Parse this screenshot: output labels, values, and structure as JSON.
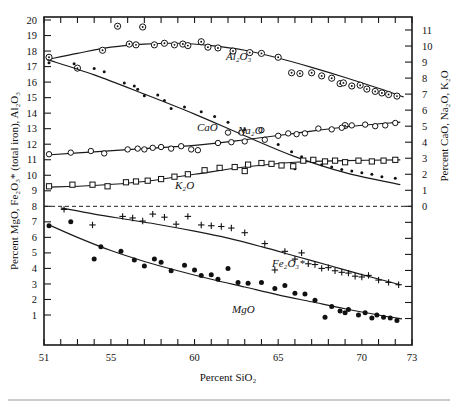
{
  "figure": {
    "background": "#ffffff",
    "ink_color": "#111111"
  },
  "axes": {
    "x_title": "Percent SiO₂",
    "y_left_title": "Percent MgO, Fe₂O₃* (total iron), Al₂O₃",
    "y_right_title": "Percent CaO, Na₂O, K₂O",
    "x_ticklabels": [
      "51",
      "55",
      "60",
      "65",
      "70",
      "73"
    ],
    "x_tickvalues": [
      51,
      55,
      60,
      65,
      70,
      73
    ],
    "y_left_ticklabels": [
      "1",
      "2",
      "3",
      "4",
      "5",
      "6",
      "7",
      "8",
      "9",
      "10",
      "11",
      "12",
      "13",
      "14",
      "15",
      "16",
      "17",
      "18",
      "19",
      "20"
    ],
    "y_right_ticklabels": [
      "0",
      "1",
      "2",
      "3",
      "4",
      "5",
      "6",
      "7",
      "8",
      "9",
      "10",
      "11"
    ],
    "zero_reference_label": "0"
  },
  "curve_labels": {
    "al2o3": "Al₂O₃",
    "cao": "CaO",
    "na2o": "Na₂O",
    "k2o": "K₂O",
    "fe2o3": "Fe₂O₃*",
    "mgo": "MgO"
  },
  "chart_data": {
    "type": "scatter",
    "title": "",
    "subtitle": "",
    "xlabel": "Percent SiO₂",
    "ylabel": "Percent MgO, Fe₂O₃* (total iron), Al₂O₃",
    "ylabel_right": "Percent CaO, Na₂O, K₂O",
    "xlim": [
      51,
      73
    ],
    "ylim_left": [
      0,
      20
    ],
    "ylim_right": [
      0,
      11
    ],
    "right_axis_offset_note": "right axis 0 aligns with left axis 8",
    "grid": false,
    "legend": "inline curve labels",
    "annotations": [
      {
        "text": "Al₂O₃",
        "x": 62.0,
        "y_left": 17.6
      },
      {
        "text": "CaO",
        "x": 60.2,
        "y_left": 13.0
      },
      {
        "text": "Na₂O",
        "x": 62.6,
        "y_left": 13.0
      },
      {
        "text": "K₂O",
        "x": 59.0,
        "y_left": 10.3
      },
      {
        "text": "Fe₂O₃*",
        "x": 64.5,
        "y_left": 5.6
      },
      {
        "text": "MgO",
        "x": 62.3,
        "y_left": 3.2
      }
    ],
    "reference_lines": [
      {
        "orientation": "horizontal",
        "y_left": 8,
        "y_right": 0,
        "style": "dashed"
      }
    ],
    "series": [
      {
        "name": "Al₂O₃",
        "axis": "left",
        "marker": "circle-with-dot",
        "points": [
          [
            51.3,
            17.6
          ],
          [
            53.0,
            16.9
          ],
          [
            54.5,
            18.05
          ],
          [
            55.4,
            19.6
          ],
          [
            56.1,
            18.45
          ],
          [
            56.5,
            18.4
          ],
          [
            56.9,
            19.55
          ],
          [
            57.6,
            18.4
          ],
          [
            58.2,
            18.5
          ],
          [
            58.8,
            18.4
          ],
          [
            59.3,
            18.45
          ],
          [
            59.6,
            18.35
          ],
          [
            60.4,
            18.6
          ],
          [
            60.8,
            18.25
          ],
          [
            61.4,
            18.2
          ],
          [
            62.3,
            18.0
          ],
          [
            63.3,
            17.9
          ],
          [
            64.0,
            17.85
          ],
          [
            65.0,
            17.6
          ],
          [
            65.8,
            16.6
          ],
          [
            66.3,
            16.55
          ],
          [
            67.0,
            16.6
          ],
          [
            67.6,
            16.4
          ],
          [
            68.2,
            16.25
          ],
          [
            68.7,
            15.9
          ],
          [
            68.9,
            15.95
          ],
          [
            69.4,
            15.75
          ],
          [
            69.9,
            15.8
          ],
          [
            70.3,
            15.55
          ],
          [
            70.8,
            15.4
          ],
          [
            71.2,
            15.3
          ],
          [
            71.6,
            15.2
          ],
          [
            72.1,
            15.1
          ],
          [
            69.0,
            13.2
          ]
        ],
        "trend": [
          [
            51.2,
            17.45
          ],
          [
            53.0,
            17.85
          ],
          [
            55.0,
            18.25
          ],
          [
            57.0,
            18.45
          ],
          [
            59.0,
            18.5
          ],
          [
            61.0,
            18.35
          ],
          [
            63.0,
            18.05
          ],
          [
            65.0,
            17.55
          ],
          [
            67.0,
            16.95
          ],
          [
            69.0,
            16.3
          ],
          [
            71.0,
            15.6
          ],
          [
            72.5,
            15.05
          ]
        ]
      },
      {
        "name": "CaO",
        "axis": "right",
        "marker": "small-dot",
        "points": [
          [
            51.3,
            8.95
          ],
          [
            52.8,
            8.9
          ],
          [
            54.0,
            8.6
          ],
          [
            54.6,
            8.4
          ],
          [
            55.8,
            7.7
          ],
          [
            56.4,
            7.5
          ],
          [
            56.6,
            7.3
          ],
          [
            57.0,
            6.9
          ],
          [
            57.8,
            6.95
          ],
          [
            58.2,
            6.6
          ],
          [
            58.6,
            6.1
          ],
          [
            59.4,
            6.2
          ],
          [
            60.4,
            5.9
          ],
          [
            61.2,
            5.6
          ],
          [
            62.0,
            5.25
          ],
          [
            63.0,
            4.8
          ],
          [
            64.2,
            4.25
          ],
          [
            65.0,
            3.85
          ],
          [
            65.8,
            3.4
          ],
          [
            66.4,
            3.1
          ],
          [
            67.0,
            2.95
          ],
          [
            67.6,
            2.6
          ],
          [
            68.2,
            2.45
          ],
          [
            68.8,
            2.3
          ],
          [
            69.4,
            2.2
          ],
          [
            70.0,
            2.1
          ],
          [
            70.6,
            2.0
          ],
          [
            71.2,
            1.85
          ],
          [
            72.0,
            1.75
          ],
          [
            66.0,
            2.35
          ]
        ],
        "trend": [
          [
            51.2,
            9.15
          ],
          [
            54.0,
            8.2
          ],
          [
            57.0,
            7.0
          ],
          [
            60.0,
            5.75
          ],
          [
            63.0,
            4.4
          ],
          [
            66.0,
            3.1
          ],
          [
            69.0,
            2.1
          ],
          [
            72.3,
            1.35
          ]
        ]
      },
      {
        "name": "Na₂O",
        "axis": "right",
        "marker": "open-circle",
        "points": [
          [
            51.3,
            3.25
          ],
          [
            52.6,
            3.35
          ],
          [
            53.8,
            3.45
          ],
          [
            54.6,
            3.3
          ],
          [
            56.0,
            3.55
          ],
          [
            56.6,
            3.6
          ],
          [
            57.0,
            3.55
          ],
          [
            57.5,
            3.65
          ],
          [
            58.0,
            3.7
          ],
          [
            58.6,
            3.6
          ],
          [
            59.2,
            3.75
          ],
          [
            59.8,
            3.55
          ],
          [
            60.2,
            3.5
          ],
          [
            61.4,
            3.95
          ],
          [
            62.2,
            4.0
          ],
          [
            63.0,
            4.05
          ],
          [
            64.2,
            4.15
          ],
          [
            65.0,
            4.4
          ],
          [
            65.6,
            4.55
          ],
          [
            66.1,
            4.5
          ],
          [
            66.6,
            4.55
          ],
          [
            67.4,
            4.85
          ],
          [
            68.2,
            4.8
          ],
          [
            68.8,
            4.9
          ],
          [
            69.4,
            5.05
          ],
          [
            70.2,
            5.1
          ],
          [
            70.8,
            5.0
          ],
          [
            71.4,
            5.05
          ],
          [
            72.0,
            5.2
          ],
          [
            62.0,
            4.6
          ],
          [
            62.8,
            4.6
          ],
          [
            64.0,
            4.75
          ]
        ],
        "trend": [
          [
            51.2,
            3.2
          ],
          [
            54.0,
            3.4
          ],
          [
            57.0,
            3.6
          ],
          [
            60.0,
            3.8
          ],
          [
            63.0,
            4.15
          ],
          [
            66.0,
            4.55
          ],
          [
            69.0,
            4.95
          ],
          [
            72.3,
            5.25
          ]
        ]
      },
      {
        "name": "K₂O",
        "axis": "right",
        "marker": "open-square",
        "points": [
          [
            51.3,
            1.25
          ],
          [
            52.7,
            1.35
          ],
          [
            53.9,
            1.35
          ],
          [
            54.8,
            1.25
          ],
          [
            55.9,
            1.5
          ],
          [
            56.5,
            1.55
          ],
          [
            57.2,
            1.6
          ],
          [
            58.0,
            1.7
          ],
          [
            58.8,
            1.85
          ],
          [
            59.6,
            2.0
          ],
          [
            60.6,
            2.25
          ],
          [
            61.5,
            2.4
          ],
          [
            62.4,
            2.45
          ],
          [
            63.2,
            2.6
          ],
          [
            64.0,
            2.7
          ],
          [
            64.6,
            2.65
          ],
          [
            65.2,
            2.55
          ],
          [
            65.9,
            2.5
          ],
          [
            66.5,
            2.85
          ],
          [
            67.1,
            2.9
          ],
          [
            67.8,
            2.8
          ],
          [
            68.4,
            2.85
          ],
          [
            69.0,
            2.75
          ],
          [
            69.8,
            2.85
          ],
          [
            70.6,
            2.8
          ],
          [
            71.3,
            2.85
          ],
          [
            72.0,
            2.9
          ],
          [
            63.0,
            2.2
          ]
        ],
        "trend": [
          [
            51.2,
            1.2
          ],
          [
            54.0,
            1.3
          ],
          [
            57.0,
            1.55
          ],
          [
            60.0,
            2.0
          ],
          [
            63.0,
            2.45
          ],
          [
            66.0,
            2.75
          ],
          [
            69.0,
            2.85
          ],
          [
            72.3,
            2.9
          ]
        ]
      },
      {
        "name": "Fe₂O₃*",
        "axis": "left",
        "marker": "plus",
        "points": [
          [
            52.2,
            7.8
          ],
          [
            53.9,
            6.8
          ],
          [
            55.7,
            7.35
          ],
          [
            56.3,
            7.25
          ],
          [
            56.9,
            7.05
          ],
          [
            57.5,
            7.5
          ],
          [
            58.2,
            7.3
          ],
          [
            58.9,
            6.85
          ],
          [
            59.6,
            7.35
          ],
          [
            60.4,
            6.8
          ],
          [
            61.0,
            6.75
          ],
          [
            61.6,
            6.7
          ],
          [
            62.2,
            6.6
          ],
          [
            63.0,
            6.3
          ],
          [
            64.2,
            5.6
          ],
          [
            65.4,
            5.1
          ],
          [
            66.0,
            4.6
          ],
          [
            66.8,
            4.3
          ],
          [
            67.2,
            4.25
          ],
          [
            67.6,
            4.0
          ],
          [
            68.0,
            4.05
          ],
          [
            68.4,
            3.85
          ],
          [
            68.8,
            3.75
          ],
          [
            69.2,
            3.7
          ],
          [
            69.6,
            3.5
          ],
          [
            70.0,
            3.45
          ],
          [
            70.4,
            3.55
          ],
          [
            71.0,
            3.25
          ],
          [
            71.6,
            3.1
          ],
          [
            72.2,
            2.95
          ],
          [
            64.8,
            3.9
          ],
          [
            66.4,
            5.0
          ]
        ],
        "trend": [
          [
            52.0,
            7.9
          ],
          [
            54.0,
            7.5
          ],
          [
            56.0,
            7.15
          ],
          [
            58.0,
            6.8
          ],
          [
            60.0,
            6.4
          ],
          [
            62.0,
            5.95
          ],
          [
            64.0,
            5.4
          ],
          [
            66.0,
            4.8
          ],
          [
            68.0,
            4.2
          ],
          [
            70.0,
            3.6
          ],
          [
            72.3,
            2.95
          ]
        ]
      },
      {
        "name": "MgO",
        "axis": "left",
        "marker": "filled-circle",
        "points": [
          [
            51.3,
            6.75
          ],
          [
            52.6,
            7.0
          ],
          [
            54.0,
            4.6
          ],
          [
            54.4,
            5.4
          ],
          [
            55.6,
            5.1
          ],
          [
            56.4,
            4.55
          ],
          [
            57.0,
            4.15
          ],
          [
            57.6,
            4.6
          ],
          [
            58.0,
            4.4
          ],
          [
            58.6,
            3.85
          ],
          [
            59.4,
            4.2
          ],
          [
            60.0,
            3.9
          ],
          [
            61.0,
            3.6
          ],
          [
            62.0,
            4.0
          ],
          [
            62.6,
            3.1
          ],
          [
            63.2,
            3.05
          ],
          [
            64.0,
            3.1
          ],
          [
            64.8,
            2.7
          ],
          [
            65.4,
            2.9
          ],
          [
            66.0,
            2.4
          ],
          [
            66.6,
            2.35
          ],
          [
            67.2,
            1.95
          ],
          [
            67.8,
            0.85
          ],
          [
            68.2,
            1.55
          ],
          [
            68.7,
            1.25
          ],
          [
            69.0,
            1.15
          ],
          [
            69.2,
            1.35
          ],
          [
            69.8,
            1.0
          ],
          [
            70.2,
            1.15
          ],
          [
            70.6,
            0.8
          ],
          [
            70.9,
            1.0
          ],
          [
            71.3,
            0.85
          ],
          [
            71.7,
            0.8
          ],
          [
            72.1,
            0.65
          ],
          [
            60.4,
            3.55
          ],
          [
            61.4,
            3.3
          ]
        ],
        "trend": [
          [
            51.2,
            6.85
          ],
          [
            53.0,
            6.0
          ],
          [
            55.0,
            5.15
          ],
          [
            57.0,
            4.45
          ],
          [
            59.0,
            3.85
          ],
          [
            61.0,
            3.3
          ],
          [
            63.0,
            2.8
          ],
          [
            65.0,
            2.3
          ],
          [
            67.0,
            1.85
          ],
          [
            69.0,
            1.4
          ],
          [
            71.0,
            1.0
          ],
          [
            72.4,
            0.75
          ]
        ]
      }
    ]
  }
}
